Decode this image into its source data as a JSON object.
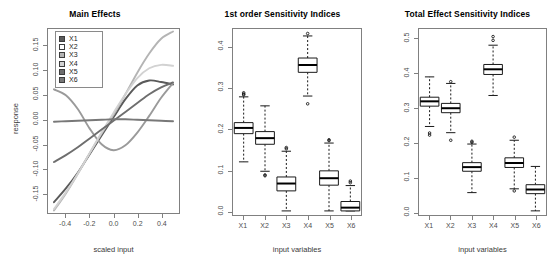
{
  "figure": {
    "panels": [
      "Main Effects",
      "1st order Sensitivity Indices",
      "Total Effect Sensitivity Indices"
    ]
  },
  "panel_main": {
    "title": "Main Effects",
    "xlabel": "scaled input",
    "ylabel": "response",
    "xticks": [
      "-0.4",
      "-0.2",
      "0.0",
      "0.2",
      "0.4"
    ],
    "yticks": [
      "0.15",
      "0.10",
      "0.05",
      "0.00",
      "-0.05",
      "-0.10",
      "-0.15"
    ],
    "legend": [
      {
        "label": "X1",
        "color": "#5a5a5a"
      },
      {
        "label": "X2",
        "color": "#ffffff"
      },
      {
        "label": "X3",
        "color": "#b4b4b4"
      },
      {
        "label": "X4",
        "color": "#d2d2d2"
      },
      {
        "label": "X5",
        "color": "#6e6e6e"
      },
      {
        "label": "X6",
        "color": "#787878"
      }
    ]
  },
  "panel_first": {
    "title": "1st order Sensitivity Indices",
    "xlabel": "input variables",
    "xticks": [
      "X1",
      "X2",
      "X3",
      "X4",
      "X5",
      "X6"
    ],
    "yticks": [
      "0.0",
      "0.1",
      "0.2",
      "0.3",
      "0.4"
    ]
  },
  "panel_total": {
    "title": "Total Effect Sensitivity Indices",
    "xlabel": "input variables",
    "xticks": [
      "X1",
      "X2",
      "X3",
      "X4",
      "X5",
      "X6"
    ],
    "yticks": [
      "0.0",
      "0.1",
      "0.2",
      "0.3",
      "0.4",
      "0.5"
    ]
  },
  "chart_data": [
    {
      "type": "line",
      "title": "Main Effects",
      "xlabel": "scaled input",
      "ylabel": "response",
      "xlim": [
        -0.55,
        0.55
      ],
      "ylim": [
        -0.19,
        0.185
      ],
      "xticks": [
        -0.4,
        -0.2,
        0.0,
        0.2,
        0.4
      ],
      "yticks": [
        -0.15,
        -0.1,
        -0.05,
        0.0,
        0.05,
        0.1,
        0.15
      ],
      "grid": false,
      "legend_position": "top-left",
      "x": [
        -0.5,
        -0.4,
        -0.3,
        -0.2,
        -0.1,
        0.0,
        0.1,
        0.2,
        0.3,
        0.4,
        0.5
      ],
      "series": [
        {
          "name": "X1",
          "color": "#5a5a5a",
          "values": [
            -0.168,
            -0.14,
            -0.108,
            -0.07,
            -0.032,
            0.005,
            0.042,
            0.07,
            0.08,
            0.077,
            0.072
          ]
        },
        {
          "name": "X2",
          "color": "#9a9a9a",
          "values": [
            0.062,
            0.05,
            0.022,
            -0.018,
            -0.05,
            -0.062,
            -0.052,
            -0.026,
            0.008,
            0.045,
            0.075
          ]
        },
        {
          "name": "X3",
          "color": "#b4b4b4",
          "values": [
            -0.185,
            -0.15,
            -0.11,
            -0.068,
            -0.028,
            0.01,
            0.052,
            0.096,
            0.135,
            0.165,
            0.18
          ]
        },
        {
          "name": "X4",
          "color": "#d2d2d2",
          "values": [
            -0.182,
            -0.148,
            -0.11,
            -0.068,
            -0.026,
            0.014,
            0.052,
            0.085,
            0.105,
            0.112,
            0.11
          ]
        },
        {
          "name": "X5",
          "color": "#6e6e6e",
          "values": [
            -0.086,
            -0.072,
            -0.056,
            -0.038,
            -0.02,
            -0.002,
            0.016,
            0.034,
            0.052,
            0.066,
            0.076
          ]
        },
        {
          "name": "X6",
          "color": "#787878",
          "values": [
            -0.004,
            -0.003,
            -0.002,
            -0.001,
            0.0,
            0.001,
            0.001,
            0.0,
            -0.001,
            -0.002,
            -0.003
          ]
        }
      ]
    },
    {
      "type": "boxplot",
      "title": "1st order Sensitivity Indices",
      "xlabel": "input variables",
      "ylabel": "",
      "categories": [
        "X1",
        "X2",
        "X3",
        "X4",
        "X5",
        "X6"
      ],
      "ylim": [
        -0.01,
        0.445
      ],
      "yticks": [
        0.0,
        0.1,
        0.2,
        0.3,
        0.4
      ],
      "grid": false,
      "boxes": [
        {
          "name": "X1",
          "whisker_low": 0.12,
          "q1": 0.189,
          "median": 0.203,
          "q3": 0.216,
          "whisker_high": 0.279,
          "outliers": [
            0.284,
            0.286,
            0.289
          ]
        },
        {
          "name": "X2",
          "whisker_low": 0.097,
          "q1": 0.163,
          "median": 0.178,
          "q3": 0.194,
          "whisker_high": 0.257,
          "outliers": [
            0.088,
            0.086
          ]
        },
        {
          "name": "X3",
          "whisker_low": 0.0,
          "q1": 0.049,
          "median": 0.067,
          "q3": 0.083,
          "whisker_high": 0.146,
          "outliers": [
            0.152,
            0.155
          ]
        },
        {
          "name": "X4",
          "whisker_low": 0.281,
          "q1": 0.339,
          "median": 0.357,
          "q3": 0.374,
          "whisker_high": 0.428,
          "outliers": [
            0.262,
            0.434
          ]
        },
        {
          "name": "X5",
          "whisker_low": 0.0,
          "q1": 0.063,
          "median": 0.08,
          "q3": 0.098,
          "whisker_high": 0.166,
          "outliers": [
            0.172,
            0.174
          ]
        },
        {
          "name": "X6",
          "whisker_low": 0.0,
          "q1": 0.0,
          "median": 0.008,
          "q3": 0.023,
          "whisker_high": 0.062,
          "outliers": [
            0.069,
            0.073
          ]
        }
      ]
    },
    {
      "type": "boxplot",
      "title": "Total Effect Sensitivity Indices",
      "xlabel": "input variables",
      "ylabel": "",
      "categories": [
        "X1",
        "X2",
        "X3",
        "X4",
        "X5",
        "X6"
      ],
      "ylim": [
        -0.01,
        0.53
      ],
      "yticks": [
        0.0,
        0.1,
        0.2,
        0.3,
        0.4,
        0.5
      ],
      "grid": false,
      "boxes": [
        {
          "name": "X1",
          "whisker_low": 0.247,
          "q1": 0.306,
          "median": 0.32,
          "q3": 0.332,
          "whisker_high": 0.391,
          "outliers": [
            0.228,
            0.222
          ]
        },
        {
          "name": "X2",
          "whisker_low": 0.229,
          "q1": 0.287,
          "median": 0.3,
          "q3": 0.314,
          "whisker_high": 0.372,
          "outliers": [
            0.377,
            0.207
          ]
        },
        {
          "name": "X3",
          "whisker_low": 0.055,
          "q1": 0.117,
          "median": 0.129,
          "q3": 0.142,
          "whisker_high": 0.196,
          "outliers": [
            0.201,
            0.204
          ]
        },
        {
          "name": "X4",
          "whisker_low": 0.337,
          "q1": 0.398,
          "median": 0.413,
          "q3": 0.427,
          "whisker_high": 0.483,
          "outliers": [
            0.497,
            0.508
          ]
        },
        {
          "name": "X5",
          "whisker_low": 0.066,
          "q1": 0.128,
          "median": 0.141,
          "q3": 0.156,
          "whisker_high": 0.207,
          "outliers": [
            0.216,
            0.06
          ]
        },
        {
          "name": "X6",
          "whisker_low": 0.002,
          "q1": 0.052,
          "median": 0.064,
          "q3": 0.078,
          "whisker_high": 0.131,
          "outliers": []
        }
      ]
    }
  ]
}
